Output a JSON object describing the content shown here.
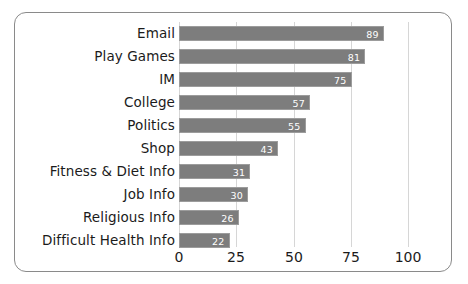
{
  "chart_data": {
    "type": "bar",
    "orientation": "horizontal",
    "title": "",
    "subtitle": "",
    "xlabel": "",
    "ylabel": "",
    "categories": [
      "Email",
      "Play Games",
      "IM",
      "College",
      "Politics",
      "Shop",
      "Fitness & Diet Info",
      "Job Info",
      "Religious Info",
      "Difficult Health Info"
    ],
    "values": [
      89,
      81,
      75,
      57,
      55,
      43,
      31,
      30,
      26,
      22
    ],
    "value_labels": [
      "89",
      "81",
      "75",
      "57",
      "55",
      "43",
      "31",
      "30",
      "26",
      "22"
    ],
    "xlim": [
      0,
      100
    ],
    "tick_labels": [
      "0",
      "25",
      "50",
      "75",
      "100"
    ],
    "tick_values": [
      0,
      25,
      50,
      75,
      100
    ],
    "grid": true,
    "grid_axis": "x",
    "legend": false,
    "colors": {
      "bar_fill": "#7d7d7d",
      "bar_border": "#9c9c9c",
      "value_label": "#ffffff",
      "gridline": "#d6d6d6",
      "text": "#1b1b1b",
      "frame_border": "#8a8a8a",
      "background": "#ffffff"
    }
  }
}
